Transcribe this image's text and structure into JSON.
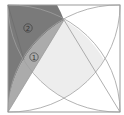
{
  "figure": {
    "type": "geometry-diagram",
    "labels": {
      "region_1": "1",
      "region_2": "2"
    },
    "colors": {
      "background": "#ffffff",
      "square_stroke": "#9a9a9a",
      "arc_stroke": "#a0a0a0",
      "region_2_fill": "#7a7a7a",
      "region_1_fill": "#ababab",
      "center_region_fill": "#ededed"
    }
  }
}
